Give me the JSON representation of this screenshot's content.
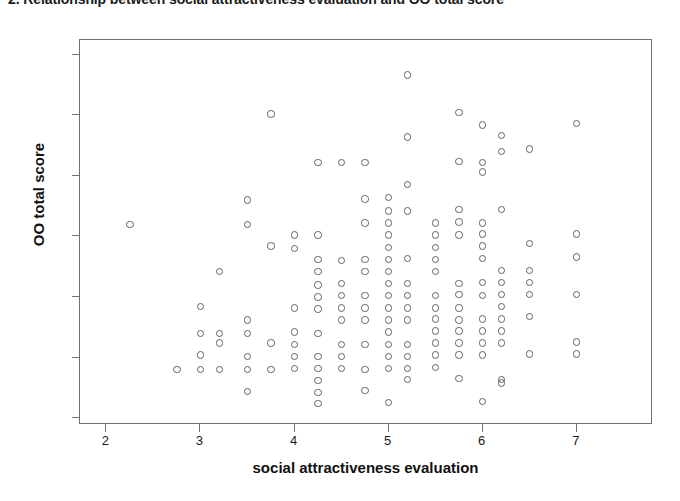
{
  "figure": {
    "title": "2. Relationship between social attractiveness evaluation and OO total score",
    "background_color": "#ffffff",
    "frame_color": "#6e6e73",
    "marker_color": "#5f6066",
    "marker_style": "open-circle"
  },
  "chart_data": {
    "type": "scatter",
    "title": "2. Relationship between social attractiveness evaluation and OO total score",
    "xlabel": "social attractiveness evaluation",
    "ylabel": "OO total score",
    "xlim": [
      1.72,
      7.81
    ],
    "ylim": [
      -0.56,
      31.2
    ],
    "xticks": [
      2,
      3,
      4,
      5,
      6,
      7
    ],
    "yticks": [
      0,
      5,
      10,
      15,
      20,
      25,
      30
    ],
    "xtick_labels": [
      "2",
      "3",
      "4",
      "5",
      "6",
      "7"
    ],
    "ytick_labels": [
      "0",
      "5",
      "10",
      "15",
      "20",
      "25",
      "30"
    ],
    "grid": false,
    "legend": false,
    "series": [
      {
        "name": "respondents",
        "marker": "open-circle",
        "points": [
          [
            2.25,
            16.0
          ],
          [
            2.75,
            4.0
          ],
          [
            3.0,
            9.2
          ],
          [
            3.0,
            7.0
          ],
          [
            3.0,
            5.2
          ],
          [
            3.0,
            4.0
          ],
          [
            3.2,
            12.1
          ],
          [
            3.2,
            7.0
          ],
          [
            3.2,
            6.2
          ],
          [
            3.2,
            4.0
          ],
          [
            3.5,
            18.0
          ],
          [
            3.5,
            16.0
          ],
          [
            3.5,
            8.1
          ],
          [
            3.5,
            7.0
          ],
          [
            3.5,
            5.1
          ],
          [
            3.5,
            4.0
          ],
          [
            3.5,
            2.2
          ],
          [
            3.75,
            25.1
          ],
          [
            3.75,
            14.2
          ],
          [
            3.75,
            6.2
          ],
          [
            3.75,
            4.0
          ],
          [
            4.0,
            15.1
          ],
          [
            4.0,
            14.0
          ],
          [
            4.0,
            9.1
          ],
          [
            4.0,
            7.1
          ],
          [
            4.0,
            6.1
          ],
          [
            4.0,
            5.1
          ],
          [
            4.0,
            4.1
          ],
          [
            4.25,
            21.1
          ],
          [
            4.25,
            15.1
          ],
          [
            4.25,
            13.1
          ],
          [
            4.25,
            12.1
          ],
          [
            4.25,
            11.0
          ],
          [
            4.25,
            10.0
          ],
          [
            4.25,
            9.0
          ],
          [
            4.25,
            7.0
          ],
          [
            4.25,
            5.1
          ],
          [
            4.25,
            4.1
          ],
          [
            4.25,
            3.1
          ],
          [
            4.25,
            2.1
          ],
          [
            4.25,
            1.2
          ],
          [
            4.5,
            21.1
          ],
          [
            4.5,
            13.0
          ],
          [
            4.5,
            11.1
          ],
          [
            4.5,
            10.1
          ],
          [
            4.5,
            9.1
          ],
          [
            4.5,
            8.1
          ],
          [
            4.5,
            6.1
          ],
          [
            4.5,
            5.1
          ],
          [
            4.5,
            4.1
          ],
          [
            4.75,
            21.1
          ],
          [
            4.75,
            18.1
          ],
          [
            4.75,
            16.1
          ],
          [
            4.75,
            13.1
          ],
          [
            4.75,
            12.1
          ],
          [
            4.75,
            10.1
          ],
          [
            4.75,
            9.1
          ],
          [
            4.75,
            8.1
          ],
          [
            4.75,
            6.1
          ],
          [
            4.75,
            4.0
          ],
          [
            4.75,
            2.3
          ],
          [
            5.0,
            18.2
          ],
          [
            5.0,
            17.1
          ],
          [
            5.0,
            16.1
          ],
          [
            5.0,
            15.1
          ],
          [
            5.0,
            14.1
          ],
          [
            5.0,
            13.1
          ],
          [
            5.0,
            12.1
          ],
          [
            5.0,
            11.1
          ],
          [
            5.0,
            10.1
          ],
          [
            5.0,
            9.1
          ],
          [
            5.0,
            8.1
          ],
          [
            5.0,
            7.1
          ],
          [
            5.0,
            6.1
          ],
          [
            5.0,
            5.1
          ],
          [
            5.0,
            4.1
          ],
          [
            5.0,
            1.3
          ],
          [
            5.2,
            28.3
          ],
          [
            5.2,
            23.2
          ],
          [
            5.2,
            19.3
          ],
          [
            5.2,
            17.1
          ],
          [
            5.2,
            13.2
          ],
          [
            5.2,
            11.1
          ],
          [
            5.2,
            10.1
          ],
          [
            5.2,
            9.1
          ],
          [
            5.2,
            8.1
          ],
          [
            5.2,
            6.1
          ],
          [
            5.2,
            5.1
          ],
          [
            5.2,
            4.1
          ],
          [
            5.2,
            3.2
          ],
          [
            5.5,
            16.1
          ],
          [
            5.5,
            15.1
          ],
          [
            5.5,
            14.1
          ],
          [
            5.5,
            13.1
          ],
          [
            5.5,
            12.1
          ],
          [
            5.5,
            10.1
          ],
          [
            5.5,
            9.1
          ],
          [
            5.5,
            8.2
          ],
          [
            5.5,
            7.2
          ],
          [
            5.5,
            6.2
          ],
          [
            5.5,
            5.2
          ],
          [
            5.5,
            4.2
          ],
          [
            5.75,
            25.2
          ],
          [
            5.75,
            21.2
          ],
          [
            5.75,
            17.2
          ],
          [
            5.75,
            16.2
          ],
          [
            5.75,
            15.1
          ],
          [
            5.75,
            11.1
          ],
          [
            5.75,
            10.2
          ],
          [
            5.75,
            9.1
          ],
          [
            5.75,
            8.1
          ],
          [
            5.75,
            7.2
          ],
          [
            5.75,
            6.2
          ],
          [
            5.75,
            5.2
          ],
          [
            5.75,
            3.3
          ],
          [
            6.0,
            24.2
          ],
          [
            6.0,
            21.1
          ],
          [
            6.0,
            20.3
          ],
          [
            6.0,
            16.1
          ],
          [
            6.0,
            15.2
          ],
          [
            6.0,
            14.2
          ],
          [
            6.0,
            13.2
          ],
          [
            6.0,
            11.2
          ],
          [
            6.0,
            10.1
          ],
          [
            6.0,
            8.2
          ],
          [
            6.0,
            7.2
          ],
          [
            6.0,
            6.2
          ],
          [
            6.0,
            5.2
          ],
          [
            6.0,
            1.4
          ],
          [
            6.2,
            23.3
          ],
          [
            6.2,
            22.0
          ],
          [
            6.2,
            17.2
          ],
          [
            6.2,
            12.2
          ],
          [
            6.2,
            11.2
          ],
          [
            6.2,
            10.2
          ],
          [
            6.2,
            9.2
          ],
          [
            6.2,
            8.2
          ],
          [
            6.2,
            7.2
          ],
          [
            6.2,
            6.2
          ],
          [
            6.2,
            3.2
          ],
          [
            6.2,
            2.9
          ],
          [
            6.5,
            22.2
          ],
          [
            6.5,
            14.4
          ],
          [
            6.5,
            12.2
          ],
          [
            6.5,
            11.2
          ],
          [
            6.5,
            10.2
          ],
          [
            6.5,
            8.4
          ],
          [
            6.5,
            5.3
          ],
          [
            7.0,
            24.3
          ],
          [
            7.0,
            15.2
          ],
          [
            7.0,
            13.3
          ],
          [
            7.0,
            10.2
          ],
          [
            7.0,
            6.3
          ],
          [
            7.0,
            5.3
          ]
        ]
      }
    ]
  }
}
